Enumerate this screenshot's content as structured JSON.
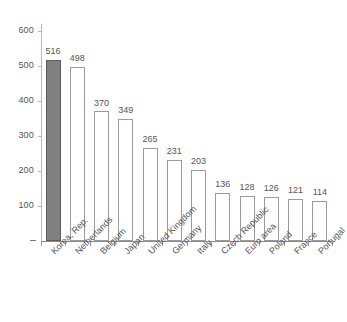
{
  "chart_data": {
    "type": "bar",
    "title": "",
    "subtitle": "",
    "xlabel": "",
    "ylabel": "",
    "ylim": [
      0,
      600
    ],
    "ytick_values": [
      600,
      500,
      400,
      300,
      200,
      100
    ],
    "ytick_labels": [
      "600",
      "500",
      "400",
      "300",
      "200",
      "100"
    ],
    "zero_tick_label": "-",
    "grid": false,
    "legend": null,
    "categories": [
      "Korea, Rep.",
      "Netherlands",
      "Belgium",
      "Japan",
      "United Kingdom",
      "Germany",
      "Italy",
      "Czech Republic",
      "Euro area",
      "Poland",
      "France",
      "Portugal"
    ],
    "values": [
      516,
      498,
      370,
      349,
      265,
      231,
      203,
      136,
      128,
      126,
      121,
      114
    ],
    "data_labels": [
      "516",
      "498",
      "370",
      "349",
      "265",
      "231",
      "203",
      "136",
      "128",
      "126",
      "121",
      "114"
    ],
    "highlight_index": 0,
    "colors": {
      "bar_fill": "#ffffff",
      "bar_stroke": "#9b9b9b",
      "highlight_fill": "#808080",
      "highlight_stroke": "#5d5d5d",
      "axis": "#8a8a8a",
      "text": "#555555",
      "background": "#ffffff"
    }
  }
}
